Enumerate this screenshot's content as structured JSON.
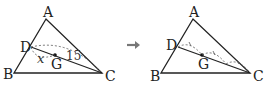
{
  "figure": {
    "left": {
      "vertices": {
        "A": "A",
        "B": "B",
        "C": "C",
        "D": "D"
      },
      "centroid": "G",
      "labels": {
        "x": "x",
        "length": "15"
      }
    },
    "arrow": "→",
    "right": {
      "vertices": {
        "A": "A",
        "B": "B",
        "C": "C",
        "D": "D"
      },
      "centroid": "G"
    }
  },
  "colors": {
    "line": "#222222",
    "dashed": "#555555",
    "arrow": "#777777"
  }
}
